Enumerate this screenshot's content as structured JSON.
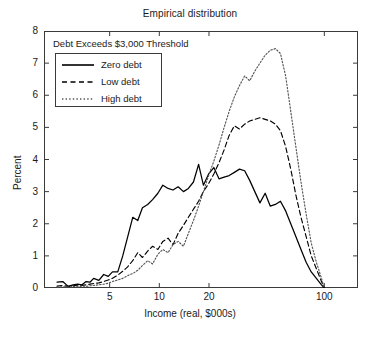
{
  "chart_data": {
    "type": "line",
    "title": "Empirical distribution",
    "xlabel": "Income (real, $000s)",
    "ylabel": "Percent",
    "annotation": "Debt Exceeds $3,000 Threshold",
    "xscale": "log",
    "xlim": [
      2.0,
      160.0
    ],
    "ylim": [
      0,
      8
    ],
    "xticks": [
      5,
      10,
      20,
      100
    ],
    "xtick_labels": [
      "5",
      "10",
      "20",
      "100"
    ],
    "yticks": [
      0,
      1,
      2,
      3,
      4,
      5,
      6,
      7,
      8
    ],
    "ytick_labels": [
      "0",
      "1",
      "2",
      "3",
      "4",
      "5",
      "6",
      "7",
      "8"
    ],
    "grid": false,
    "legend_position": "upper left",
    "legend_entries": [
      "Zero debt",
      "Low debt",
      "High debt"
    ],
    "x": [
      2.4,
      2.6,
      2.8,
      3.0,
      3.2,
      3.4,
      3.6,
      3.8,
      4.0,
      4.3,
      4.6,
      4.9,
      5.2,
      5.6,
      6.0,
      6.4,
      6.9,
      7.4,
      7.9,
      8.5,
      9.1,
      9.8,
      10.5,
      11.3,
      12.1,
      13.0,
      14.0,
      15.0,
      16.1,
      17.3,
      18.5,
      19.9,
      21.4,
      23.0,
      24.7,
      26.5,
      28.5,
      30.6,
      32.9,
      35.3,
      37.9,
      40.7,
      43.8,
      47.0,
      50.5,
      54.2,
      58.3,
      62.6,
      67.2,
      72.2,
      77.6,
      83.3,
      89.5,
      96.1,
      100.0
    ],
    "series": [
      {
        "name": "Zero debt",
        "style": "solid",
        "color": "#000000",
        "values": [
          0.18,
          0.2,
          0.05,
          0.1,
          0.12,
          0.1,
          0.2,
          0.18,
          0.3,
          0.24,
          0.42,
          0.36,
          0.5,
          0.5,
          1.0,
          1.55,
          2.2,
          2.1,
          2.5,
          2.6,
          2.75,
          2.95,
          3.2,
          3.1,
          3.05,
          3.15,
          3.0,
          3.1,
          3.3,
          3.85,
          3.2,
          3.55,
          3.75,
          3.4,
          3.45,
          3.5,
          3.6,
          3.7,
          3.65,
          3.35,
          3.0,
          2.65,
          2.95,
          2.55,
          2.6,
          2.7,
          2.4,
          2.0,
          1.6,
          1.2,
          0.8,
          0.5,
          0.3,
          0.1,
          0.0
        ]
      },
      {
        "name": "Low debt",
        "style": "dashed",
        "color": "#000000",
        "values": [
          0.06,
          0.08,
          0.05,
          0.07,
          0.09,
          0.08,
          0.1,
          0.12,
          0.14,
          0.16,
          0.2,
          0.25,
          0.3,
          0.4,
          0.52,
          0.65,
          0.85,
          1.1,
          0.95,
          1.15,
          1.3,
          1.2,
          1.45,
          1.55,
          1.35,
          1.7,
          1.95,
          2.2,
          2.45,
          2.7,
          3.0,
          3.25,
          3.55,
          3.9,
          4.3,
          4.75,
          5.05,
          4.95,
          5.1,
          5.2,
          5.25,
          5.3,
          5.25,
          5.2,
          5.1,
          4.9,
          4.4,
          3.7,
          2.9,
          2.2,
          1.6,
          1.0,
          0.6,
          0.2,
          0.0
        ]
      },
      {
        "name": "High debt",
        "style": "dotted",
        "color": "#555555",
        "values": [
          0.03,
          0.04,
          0.03,
          0.05,
          0.04,
          0.06,
          0.05,
          0.07,
          0.08,
          0.1,
          0.12,
          0.15,
          0.2,
          0.25,
          0.3,
          0.38,
          0.45,
          0.55,
          0.7,
          0.85,
          0.75,
          1.05,
          1.2,
          1.1,
          1.35,
          1.45,
          1.3,
          1.7,
          2.1,
          2.55,
          3.0,
          3.5,
          3.95,
          4.45,
          5.0,
          5.5,
          5.95,
          6.3,
          6.6,
          6.45,
          6.75,
          7.0,
          7.25,
          7.4,
          7.45,
          7.3,
          6.6,
          5.5,
          4.4,
          3.3,
          2.3,
          1.4,
          0.8,
          0.3,
          0.0
        ]
      }
    ]
  }
}
